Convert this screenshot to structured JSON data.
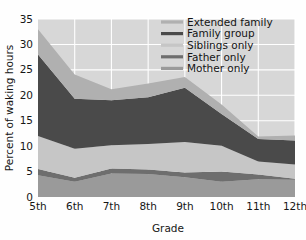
{
  "chart_data": {
    "type": "area",
    "stacked": true,
    "title": "",
    "xlabel": "Grade",
    "ylabel": "Percent of waking hours",
    "categories": [
      "5th",
      "6th",
      "7th",
      "8th",
      "9th",
      "10th",
      "11th",
      "12th"
    ],
    "x": [
      0,
      1,
      2,
      3,
      4,
      5,
      6,
      7
    ],
    "ylim": [
      0,
      35
    ],
    "yticks": [
      0,
      5,
      10,
      15,
      20,
      25,
      30,
      35
    ],
    "ytick_labels": [
      "0",
      "5",
      "10",
      "15",
      "20",
      "25",
      "30",
      "35"
    ],
    "grid": true,
    "legend_position": "top-right",
    "series": [
      {
        "name": "Mother only",
        "color": "#9a9a9a",
        "values": [
          4.3,
          3.0,
          4.6,
          4.5,
          3.9,
          3.0,
          3.5,
          3.4
        ]
      },
      {
        "name": "Father only",
        "color": "#6e6e6e",
        "values": [
          1.2,
          0.8,
          1.0,
          0.9,
          0.9,
          2.0,
          0.9,
          0.2
        ]
      },
      {
        "name": "Siblings only",
        "color": "#c6c6c6",
        "values": [
          6.5,
          5.7,
          4.6,
          5.0,
          6.0,
          5.1,
          2.6,
          2.8
        ]
      },
      {
        "name": "Family group",
        "color": "#4a4a4a",
        "values": [
          16.0,
          9.8,
          8.8,
          9.2,
          10.7,
          6.2,
          4.4,
          4.7
        ]
      },
      {
        "name": "Extended family",
        "color": "#b0b0b0",
        "values": [
          5.0,
          4.8,
          2.2,
          2.7,
          2.1,
          1.9,
          0.5,
          1.0
        ]
      }
    ],
    "totals": [
      33.0,
      24.1,
      21.2,
      22.3,
      23.6,
      18.2,
      11.9,
      12.1
    ],
    "colors": {
      "plot_background": "#d7d7d7",
      "gridline": "#ffffff",
      "page_background": "#fefefe",
      "text": "#161616"
    }
  },
  "legend": {
    "items": [
      {
        "label": "Extended family",
        "color": "#b0b0b0"
      },
      {
        "label": "Family group",
        "color": "#4a4a4a"
      },
      {
        "label": "Siblings only",
        "color": "#c6c6c6"
      },
      {
        "label": "Father only",
        "color": "#6e6e6e"
      },
      {
        "label": "Mother only",
        "color": "#9a9a9a"
      }
    ]
  },
  "axes": {
    "y_title": "Percent of waking hours",
    "x_title": "Grade"
  }
}
